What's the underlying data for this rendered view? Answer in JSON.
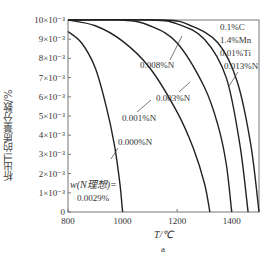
{
  "chart_data": {
    "type": "line",
    "title": "",
    "xlabel": "T/℃",
    "ylabel": "析出Ti的质量分数/%",
    "subfigure_label": "a",
    "xlim": [
      800,
      1500
    ],
    "ylim": [
      0,
      0.01
    ],
    "x_ticks": [
      "800",
      "1000",
      "1200",
      "1400"
    ],
    "y_ticks": [
      "0",
      "1×10⁻³",
      "2×10⁻³",
      "3×10⁻³",
      "4×10⁻³",
      "5×10⁻³",
      "6×10⁻³",
      "7×10⁻³",
      "8×10⁻³",
      "9×10⁻³",
      "10×10⁻³"
    ],
    "grid": false,
    "composition_note": [
      "0.1%C",
      "1.4%Mn",
      "0.01%Ti",
      "0.013%N"
    ],
    "ideal_note": [
      "w(N理想)=",
      "0.0029%"
    ],
    "series": [
      {
        "name": "0.000%N",
        "x": [
          800,
          850,
          900,
          940,
          970,
          990,
          1000
        ],
        "y": [
          0.0094,
          0.0088,
          0.0075,
          0.0055,
          0.0035,
          0.0015,
          0.0
        ]
      },
      {
        "name": "0.001%N",
        "x": [
          800,
          900,
          1000,
          1100,
          1200,
          1260,
          1300,
          1320
        ],
        "y": [
          0.01,
          0.0097,
          0.0089,
          0.0075,
          0.0052,
          0.0033,
          0.0015,
          0.0
        ]
      },
      {
        "name": "0.003%N",
        "x": [
          800,
          1000,
          1100,
          1200,
          1300,
          1350,
          1380,
          1400
        ],
        "y": [
          0.01,
          0.01,
          0.0097,
          0.0088,
          0.0065,
          0.0045,
          0.0025,
          0.0
        ]
      },
      {
        "name": "0.008%N",
        "x": [
          800,
          1100,
          1200,
          1300,
          1380,
          1430,
          1460
        ],
        "y": [
          0.01,
          0.01,
          0.0098,
          0.009,
          0.007,
          0.0035,
          0.0
        ]
      },
      {
        "name": "0.013%N",
        "x": [
          800,
          1150,
          1250,
          1350,
          1420,
          1470,
          1500
        ],
        "y": [
          0.01,
          0.01,
          0.0097,
          0.0088,
          0.0068,
          0.0035,
          0.0
        ]
      }
    ]
  }
}
